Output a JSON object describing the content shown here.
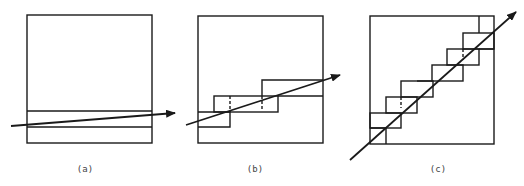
{
  "diagram": {
    "panels": [
      {
        "id": "a",
        "label": "(a)",
        "description": "Ray passing nearly horizontally through a single horizontal band of a square volume"
      },
      {
        "id": "b",
        "label": "(b)",
        "description": "Ray with moderate slope traversing a staircase of offset cells"
      },
      {
        "id": "c",
        "label": "(c)",
        "description": "Ray with steep diagonal slope traversing a long staircase of cells"
      }
    ],
    "stroke_color": "#1a1a1a",
    "background": "#ffffff"
  }
}
